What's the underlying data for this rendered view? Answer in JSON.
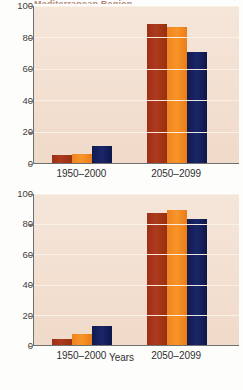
{
  "figure": {
    "clipped_title": "Mediterranean Region",
    "xlabel": "Years",
    "y_ticks": [
      "0",
      "20",
      "40",
      "60",
      "80",
      "100"
    ],
    "categories": [
      "1950–2000",
      "2050–2099"
    ],
    "colors": {
      "series_1": "#a8331a",
      "series_2": "#f08220",
      "series_3": "#13205c",
      "plot_background": "#f2dfd0",
      "gridline": "#fbf0e6",
      "axis": "#6f6f6f",
      "text": "#2f2f2f"
    }
  },
  "chart_data": [
    {
      "type": "bar",
      "title": "Mediterranean Region",
      "panel": "top",
      "xlabel": "",
      "ylabel": "",
      "ylim": [
        0,
        100
      ],
      "yticks": [
        0,
        20,
        40,
        60,
        80,
        100
      ],
      "grid": true,
      "legend": "none",
      "categories": [
        "1950–2000",
        "2050–2099"
      ],
      "series": [
        {
          "name": "series-1",
          "color": "#a8331a",
          "values": [
            5,
            88
          ]
        },
        {
          "name": "series-2",
          "color": "#f08220",
          "values": [
            5.5,
            86
          ]
        },
        {
          "name": "series-3",
          "color": "#13205c",
          "values": [
            11,
            70
          ]
        }
      ]
    },
    {
      "type": "bar",
      "title": "",
      "panel": "bottom",
      "xlabel": "Years",
      "ylabel": "",
      "ylim": [
        0,
        100
      ],
      "yticks": [
        0,
        20,
        40,
        60,
        80,
        100
      ],
      "grid": true,
      "legend": "none",
      "categories": [
        "1950–2000",
        "2050–2099"
      ],
      "series": [
        {
          "name": "series-1",
          "color": "#a8331a",
          "values": [
            4,
            87
          ]
        },
        {
          "name": "series-2",
          "color": "#f08220",
          "values": [
            7,
            89
          ]
        },
        {
          "name": "series-3",
          "color": "#13205c",
          "values": [
            12.5,
            83
          ]
        }
      ]
    }
  ]
}
